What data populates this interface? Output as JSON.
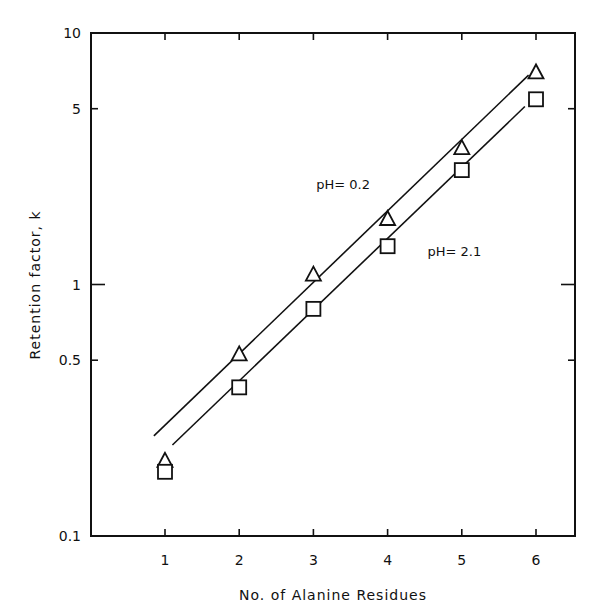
{
  "chart_data": {
    "type": "scatter",
    "title": "",
    "xlabel": "No. of Alanine Residues",
    "ylabel": "Retention factor, k",
    "yscale": "log",
    "xlim": [
      0,
      6.5
    ],
    "ylim": [
      0.1,
      10
    ],
    "x_ticks": [
      1,
      2,
      3,
      4,
      5,
      6
    ],
    "x_tick_labels": [
      "1",
      "2",
      "3",
      "4",
      "5",
      "6"
    ],
    "y_ticks": [
      0.1,
      0.5,
      1,
      5,
      10
    ],
    "y_tick_labels": [
      "0.1",
      "0.5",
      "1",
      "5",
      "10"
    ],
    "grid": false,
    "legend": null,
    "x": [
      1,
      2,
      3,
      4,
      5,
      6
    ],
    "series": [
      {
        "name": "pH = 0.2",
        "marker": "triangle",
        "values": [
          0.2,
          0.53,
          1.1,
          1.83,
          3.5,
          7.0
        ],
        "fit_line": {
          "x_start": 0.85,
          "k_start": 0.25,
          "x_end": 5.9,
          "k_end": 6.8
        }
      },
      {
        "name": "pH = 2.1",
        "marker": "square",
        "values": [
          0.18,
          0.39,
          0.8,
          1.42,
          2.85,
          5.45
        ],
        "fit_line": {
          "x_start": 1.1,
          "k_start": 0.23,
          "x_end": 5.85,
          "k_end": 5.1
        }
      }
    ],
    "annotations": [
      {
        "text": "pH= 0.2",
        "x": 3.4,
        "k": 2.4
      },
      {
        "text": "pH= 2.1",
        "x": 4.9,
        "k": 1.3
      }
    ]
  }
}
